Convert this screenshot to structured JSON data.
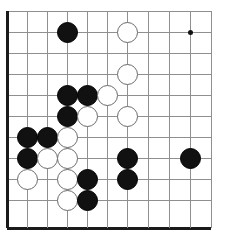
{
  "board": {
    "name": "go-board",
    "type": "go",
    "cols": 11,
    "rows": 11,
    "cell_size": 20.4,
    "origin_x": 7,
    "origin_y": 11,
    "stone_diameter": 21,
    "colors": {
      "background": "#ffffff",
      "grid_line": "#8f8f8f",
      "edge_line": "#1a1a1a",
      "black_stone": "#111111",
      "white_stone": "#ffffff",
      "white_stone_border": "#6b6b6b",
      "star_point": "#111111"
    },
    "x_positions": [
      7,
      27,
      47,
      67,
      87,
      107,
      127,
      148,
      169,
      190,
      211
    ],
    "y_positions": [
      11,
      32,
      53,
      74,
      95,
      116,
      137,
      158,
      179,
      200,
      228
    ],
    "thick_edges": [
      "left",
      "bottom"
    ],
    "star_points": [
      {
        "col": 10,
        "row": 2
      }
    ],
    "stones": [
      {
        "color": "black",
        "col": 4,
        "row": 2
      },
      {
        "color": "white",
        "col": 7,
        "row": 2
      },
      {
        "color": "white",
        "col": 7,
        "row": 4
      },
      {
        "color": "black",
        "col": 4,
        "row": 5
      },
      {
        "color": "black",
        "col": 5,
        "row": 5
      },
      {
        "color": "white",
        "col": 6,
        "row": 5
      },
      {
        "color": "black",
        "col": 4,
        "row": 6
      },
      {
        "color": "white",
        "col": 5,
        "row": 6
      },
      {
        "color": "white",
        "col": 7,
        "row": 6
      },
      {
        "color": "black",
        "col": 2,
        "row": 7
      },
      {
        "color": "black",
        "col": 3,
        "row": 7
      },
      {
        "color": "white",
        "col": 4,
        "row": 7
      },
      {
        "color": "black",
        "col": 2,
        "row": 8
      },
      {
        "color": "white",
        "col": 3,
        "row": 8
      },
      {
        "color": "white",
        "col": 4,
        "row": 8
      },
      {
        "color": "black",
        "col": 7,
        "row": 8
      },
      {
        "color": "black",
        "col": 10,
        "row": 8
      },
      {
        "color": "white",
        "col": 2,
        "row": 9
      },
      {
        "color": "white",
        "col": 4,
        "row": 9
      },
      {
        "color": "black",
        "col": 5,
        "row": 9
      },
      {
        "color": "black",
        "col": 7,
        "row": 9
      },
      {
        "color": "white",
        "col": 4,
        "row": 10
      },
      {
        "color": "black",
        "col": 5,
        "row": 10
      }
    ],
    "stone_counts": {
      "black": 12,
      "white": 11,
      "total": 23
    }
  }
}
